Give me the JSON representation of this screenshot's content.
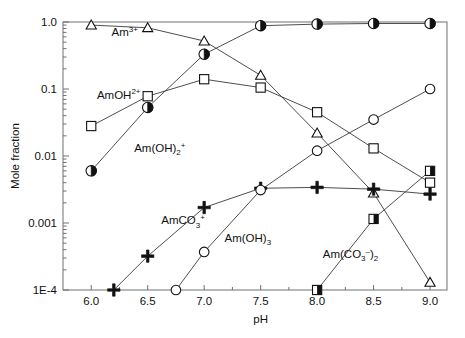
{
  "chart_data": {
    "type": "line",
    "title": "",
    "xlabel": "pH",
    "ylabel": "Mole fraction",
    "xlim": [
      5.75,
      9.15
    ],
    "ylim": [
      0.0001,
      1.0
    ],
    "yscale": "log",
    "grid": false,
    "legend_position": "inline-annotations",
    "xticks": [
      "6.0",
      "6.5",
      "7.0",
      "7.5",
      "8.0",
      "8.5",
      "9.0"
    ],
    "xtick_values": [
      6.0,
      6.5,
      7.0,
      7.5,
      8.0,
      8.5,
      9.0
    ],
    "yticks": [
      "1.0",
      "0.1",
      "0.01",
      "0.001",
      "1E-4"
    ],
    "ytick_values": [
      1.0,
      0.1,
      0.01,
      0.001,
      0.0001
    ],
    "series": [
      {
        "name": "Am3+",
        "label": "Am",
        "label_sup": "3+",
        "label_sub": "",
        "marker": "triangle-open",
        "label_x": 6.18,
        "label_y": 0.62,
        "x": [
          6.0,
          6.5,
          7.0,
          7.5,
          8.0,
          8.5,
          9.0
        ],
        "y": [
          0.9,
          0.82,
          0.52,
          0.16,
          0.022,
          0.0028,
          0.00013
        ]
      },
      {
        "name": "AmOH2+",
        "label": "AmOH",
        "label_sup": "2+",
        "label_sub": "",
        "marker": "square-open",
        "label_x": 6.05,
        "label_y": 0.072,
        "x": [
          6.0,
          6.5,
          7.0,
          7.5,
          8.0,
          8.5,
          9.0
        ],
        "y": [
          0.028,
          0.078,
          0.14,
          0.105,
          0.045,
          0.013,
          0.004
        ]
      },
      {
        "name": "Am(OH)2+",
        "label": "Am(OH)",
        "label_sup": "+",
        "label_sub": "2",
        "marker": "circle-half",
        "label_x": 6.38,
        "label_y": 0.0115,
        "x": [
          6.0,
          6.5,
          7.0,
          7.5,
          8.0,
          8.5,
          9.0
        ],
        "y": [
          0.006,
          0.053,
          0.33,
          0.88,
          0.93,
          0.95,
          0.95
        ]
      },
      {
        "name": "AmCO3+",
        "label": "AmCO",
        "label_sup": "+",
        "label_sub": "3",
        "marker": "plus",
        "label_x": 6.62,
        "label_y": 0.00095,
        "x": [
          6.2,
          6.5,
          7.0,
          7.5,
          8.0,
          8.5,
          9.0
        ],
        "y": [
          0.0001,
          0.00032,
          0.0017,
          0.0033,
          0.0034,
          0.0032,
          0.0027
        ]
      },
      {
        "name": "Am(OH)3",
        "label": "Am(OH)",
        "label_sup": "",
        "label_sub": "3",
        "marker": "circle-open",
        "label_x": 7.18,
        "label_y": 0.00052,
        "x": [
          6.75,
          7.0,
          7.5,
          8.0,
          8.5,
          9.0
        ],
        "y": [
          0.0001,
          0.00037,
          0.0031,
          0.012,
          0.035,
          0.1
        ]
      },
      {
        "name": "Am(CO3)2-",
        "label": "Am(CO",
        "label_sup": "–",
        "label_sub": "3",
        "label_tail": ")",
        "label_sub2": "2",
        "marker": "square-half",
        "label_x": 8.05,
        "label_y": 0.0003,
        "x": [
          8.0,
          8.5,
          9.0
        ],
        "y": [
          0.0001,
          0.00115,
          0.006
        ]
      }
    ]
  },
  "axes": {
    "y_title": "Mole fraction",
    "x_title": "pH"
  }
}
